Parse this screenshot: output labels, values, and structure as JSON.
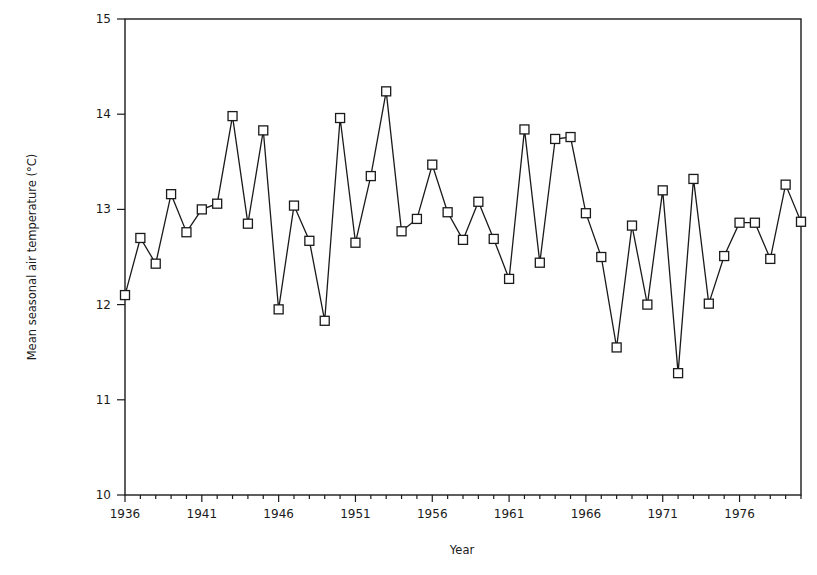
{
  "chart_data": {
    "type": "line",
    "title": "",
    "xlabel": "Year",
    "ylabel": "Mean seasonal air temperature (°C)",
    "xlim": [
      1936,
      1980
    ],
    "ylim": [
      10,
      15
    ],
    "grid": false,
    "legend": null,
    "marker": "open-square",
    "x_tick_labels": [
      "1936",
      "1941",
      "1946",
      "1951",
      "1956",
      "1961",
      "1966",
      "1971",
      "1976"
    ],
    "y_tick_labels": [
      "10",
      "11",
      "12",
      "13",
      "14",
      "15"
    ],
    "x": [
      1936,
      1937,
      1938,
      1939,
      1940,
      1941,
      1942,
      1943,
      1944,
      1945,
      1946,
      1947,
      1948,
      1949,
      1950,
      1951,
      1952,
      1953,
      1954,
      1955,
      1956,
      1957,
      1958,
      1959,
      1960,
      1961,
      1962,
      1963,
      1964,
      1965,
      1966,
      1967,
      1968,
      1969,
      1970,
      1971,
      1972,
      1973,
      1974,
      1975,
      1976,
      1977,
      1978,
      1979,
      1980
    ],
    "series": [
      {
        "name": "Mean seasonal air temperature",
        "values": [
          12.1,
          12.7,
          12.43,
          13.16,
          12.76,
          13.0,
          13.06,
          13.98,
          12.85,
          13.83,
          11.95,
          13.04,
          12.67,
          11.83,
          13.96,
          12.65,
          13.35,
          14.24,
          12.77,
          12.9,
          13.47,
          12.97,
          12.68,
          13.08,
          12.69,
          12.27,
          13.84,
          12.44,
          13.74,
          13.76,
          12.96,
          12.5,
          11.55,
          12.83,
          12.0,
          13.2,
          11.28,
          13.32,
          12.01,
          12.51,
          12.86,
          12.86,
          12.48,
          13.26,
          12.87
        ]
      }
    ]
  },
  "colors": {
    "line": "#1a1a1a",
    "background": "#ffffff"
  }
}
